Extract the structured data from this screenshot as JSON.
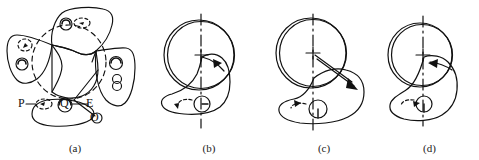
{
  "figure": {
    "background_color": "#ffffff",
    "line_color": "#111111",
    "panel_count": 4
  },
  "panels": [
    {
      "caption": "(a)",
      "name": "panel-a-composite-arm-positions",
      "description": "Three overlapping rocker arm outlines arranged around a dashed reference circle, with labelled points",
      "labels": [
        {
          "text": "P",
          "name": "label-p"
        },
        {
          "text": "Q",
          "name": "label-q"
        },
        {
          "text": "E",
          "name": "label-e"
        },
        {
          "text": "O",
          "name": "label-o"
        }
      ],
      "features": {
        "reference_circle_style": "dashed",
        "arm_outlines": 3,
        "pivot_holes": 4
      }
    },
    {
      "caption": "(b)",
      "name": "panel-b-arm-position-1",
      "description": "Cam ring with rocker arm, vertical dash-dot centre line, rotation arrow pointing right",
      "features": {
        "centerline_style": "dash-dot",
        "centerline_orientation": "vertical",
        "arrow_direction": "right",
        "cam_ring": "double-circle",
        "pivot_hole": 1
      }
    },
    {
      "caption": "(c)",
      "name": "panel-c-arm-position-2",
      "description": "Cam ring with rocker arm rotated, vertical dash-dot centre line, long arrow pointing down-right",
      "features": {
        "centerline_style": "dash-dot",
        "centerline_orientation": "vertical",
        "arrow_direction": "down-right",
        "cam_ring": "double-circle",
        "pivot_hole": 1
      }
    },
    {
      "caption": "(d)",
      "name": "panel-d-arm-position-3",
      "description": "Cam ring with rocker arm, vertical dash-dot centre line, rotation arrow pointing left",
      "features": {
        "centerline_style": "dash-dot",
        "centerline_orientation": "vertical",
        "arrow_direction": "left",
        "cam_ring": "double-circle",
        "pivot_hole": 1
      }
    }
  ]
}
